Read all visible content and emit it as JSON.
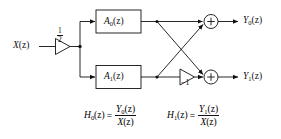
{
  "figure": {
    "type": "signal-flow-block-diagram",
    "line_color": "#111111",
    "background_color": "#ffffff"
  },
  "input": {
    "label_base": "X",
    "label_arg": "(z)",
    "gain_numerator": "1",
    "gain_denominator": "2"
  },
  "blocks": [
    {
      "name": "block-a0",
      "base": "A",
      "subscript": "0",
      "arg": "(z)"
    },
    {
      "name": "block-a1",
      "base": "A",
      "subscript": "1",
      "arg": "(z)"
    }
  ],
  "gains": [
    {
      "name": "gain-half",
      "value": "1/2"
    },
    {
      "name": "gain-minus-one",
      "value": "−1"
    }
  ],
  "adders": [
    {
      "name": "adder-top",
      "symbol": "+"
    },
    {
      "name": "adder-bottom",
      "symbol": "+"
    }
  ],
  "outputs": [
    {
      "name": "output-y0",
      "base": "Y",
      "subscript": "0",
      "arg": "(z)"
    },
    {
      "name": "output-y1",
      "base": "Y",
      "subscript": "1",
      "arg": "(z)"
    }
  ],
  "equations": [
    {
      "name": "equation-h0",
      "lhs_base": "H",
      "lhs_sub": "0",
      "lhs_arg": "(z)",
      "equals": "=",
      "num_base": "Y",
      "num_sub": "0",
      "num_arg": "(z)",
      "den_base": "X",
      "den_arg": "(z)"
    },
    {
      "name": "equation-h1",
      "lhs_base": "H",
      "lhs_sub": "1",
      "lhs_arg": "(z)",
      "equals": "=",
      "num_base": "Y",
      "num_sub": "1",
      "num_arg": "(z)",
      "den_base": "X",
      "den_arg": "(z)"
    }
  ]
}
